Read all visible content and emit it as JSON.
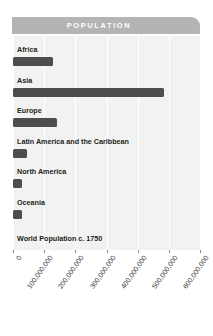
{
  "header": {
    "title": "POPULATION"
  },
  "colors": {
    "banner": "#b4b4b4",
    "plot_background": "#f2f2f2",
    "gridline": "#ffffff",
    "bar": "#4d4d4d",
    "label_text": "#231f20",
    "tick_text": "#3b3b3b",
    "banner_text": "#ffffff"
  },
  "caption": "World Population c. 1750",
  "chart_data": {
    "type": "bar",
    "orientation": "horizontal",
    "title": "POPULATION",
    "annotations": [
      "World Population c. 1750"
    ],
    "categories": [
      "Africa",
      "Asia",
      "Europe",
      "Latin America and the Caribbean",
      "North America",
      "Oceania"
    ],
    "values": [
      128000000,
      483000000,
      140000000,
      45000000,
      30000000,
      30000000
    ],
    "xlabel": "",
    "ylabel": "",
    "xlim": [
      0,
      600000000
    ],
    "tick_values": [
      0,
      100000000,
      200000000,
      300000000,
      400000000,
      500000000,
      600000000
    ],
    "tick_labels": [
      "0",
      "100,000,000",
      "200,000,000",
      "300,000,000",
      "400,000,000",
      "500,000,000",
      "600,000,000"
    ],
    "grid": true,
    "legend": "none"
  }
}
